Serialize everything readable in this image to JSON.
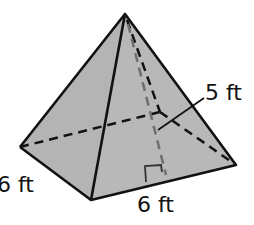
{
  "figure": {
    "type": "square pyramid",
    "colors": {
      "face": "#b4b4b4",
      "edge": "#111111",
      "height_line": "#6e6e6e",
      "background": "#ffffff"
    },
    "labels": {
      "slant_height": "5 ft",
      "base_side_left": "6 ft",
      "base_side_front": "6 ft"
    }
  }
}
